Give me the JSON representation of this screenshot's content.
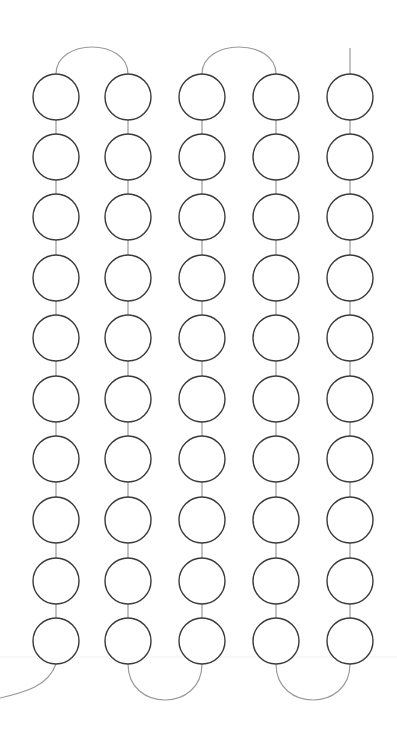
{
  "diagram": {
    "type": "serpentine-chain",
    "columns": 5,
    "rows": 10,
    "column_x": [
      56,
      128,
      202,
      276,
      350
    ],
    "row_y": [
      97,
      157,
      217,
      278,
      338,
      399,
      459,
      520,
      581,
      641
    ],
    "radius": 23,
    "colors": {
      "background": "#ffffff",
      "circle_stroke": "#3a3a3a",
      "connector_stroke": "#9a9a9a",
      "guide_line": "#f1f1f1"
    },
    "guide_line_y": 657
  }
}
